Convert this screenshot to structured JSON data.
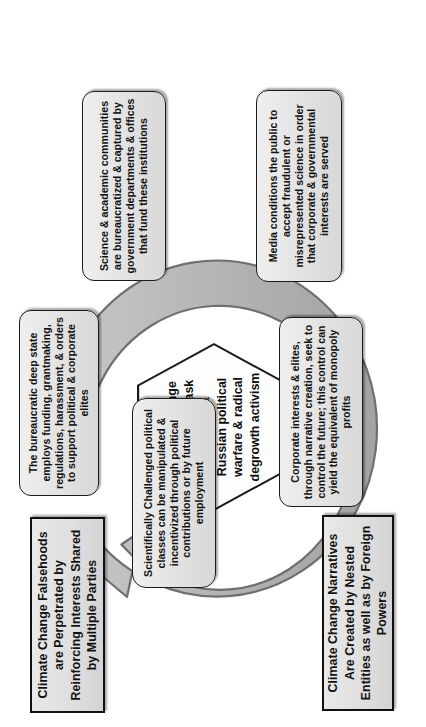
{
  "diagram": {
    "type": "cycle-diagram",
    "center": {
      "shape": "hexagon",
      "text": "Climate change narratives mask Chinese & Russian political warfare & radical degrowth activism"
    },
    "titles": [
      {
        "id": "title-top",
        "text": "Climate Change Falsehoods are Perpetrated by Reinforcing Interests Shared by Multiple Parties"
      },
      {
        "id": "title-bottom",
        "text": "Climate Change Narratives Are Created by Nested Entities as well as by Foreign Powers"
      }
    ],
    "nodes": [
      {
        "id": "node-deep-state",
        "text": "The bureaucratic deep state employs funding, grantmaking, regulations, harassment, & orders to support political & corporate elites"
      },
      {
        "id": "node-science-academia",
        "text": "Science & academic communities are bureaucratized & captured by government departments & offices that fund these institutions"
      },
      {
        "id": "node-media",
        "text": "Media conditions the public to accept fraudulent or misrepresented science in order that corporate & governmental interests are served"
      },
      {
        "id": "node-corporate-interests",
        "text": "Corporate interests & elites, through narrative creation, seek to control the future; this control can yield the equivalent of monopoly profits"
      },
      {
        "id": "node-political-classes",
        "text": "Scientifically Challenged political classes can be manipulated & incentivized through political contributions or by future employment"
      }
    ],
    "colors": {
      "node_fill": "#e3e3e3",
      "node_border": "#1b1b1b",
      "ring_fill": "#b3b3b3",
      "ring_border": "#6f6f6f",
      "page_background": "#ffffff",
      "hexagon_fill": "#fdfdfd"
    },
    "arrow": {
      "direction": "clockwise",
      "style": "circular-arrow-ring",
      "head": "single"
    }
  }
}
